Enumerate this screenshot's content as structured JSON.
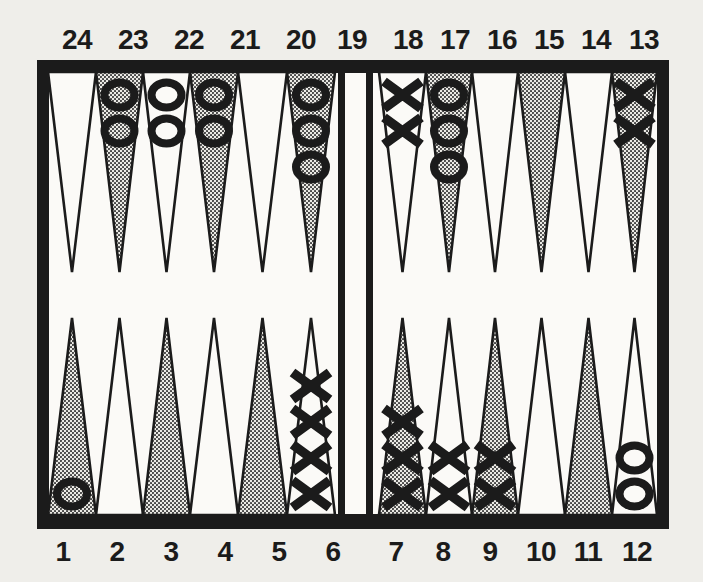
{
  "page": {
    "background_color": "#efeeea"
  },
  "board": {
    "ink_color": "#1b1b1b",
    "field_color": "#fbfaf7",
    "shaded_point_style": "halftone-dots",
    "halftone_dot_color": "#3c3c3c",
    "halftone_bg_color": "#ecebe6",
    "top_labels": [
      "24",
      "23",
      "22",
      "21",
      "20",
      "19",
      "18",
      "17",
      "16",
      "15",
      "14",
      "13"
    ],
    "bottom_labels": [
      "1",
      "2",
      "3",
      "4",
      "5",
      "6",
      "7",
      "8",
      "9",
      "10",
      "11",
      "12"
    ],
    "piece_symbols": {
      "o_player": "O",
      "x_player": "X"
    },
    "bar_checkers": 0,
    "points": [
      {
        "number": 1,
        "side": "bottom",
        "shaded": true,
        "checkers": {
          "symbol": "O",
          "count": 1
        }
      },
      {
        "number": 2,
        "side": "bottom",
        "shaded": false,
        "checkers": null
      },
      {
        "number": 3,
        "side": "bottom",
        "shaded": true,
        "checkers": null
      },
      {
        "number": 4,
        "side": "bottom",
        "shaded": false,
        "checkers": null
      },
      {
        "number": 5,
        "side": "bottom",
        "shaded": true,
        "checkers": null
      },
      {
        "number": 6,
        "side": "bottom",
        "shaded": false,
        "checkers": {
          "symbol": "X",
          "count": 4
        }
      },
      {
        "number": 7,
        "side": "bottom",
        "shaded": true,
        "checkers": {
          "symbol": "X",
          "count": 3
        }
      },
      {
        "number": 8,
        "side": "bottom",
        "shaded": false,
        "checkers": {
          "symbol": "X",
          "count": 2
        }
      },
      {
        "number": 9,
        "side": "bottom",
        "shaded": true,
        "checkers": {
          "symbol": "X",
          "count": 2
        }
      },
      {
        "number": 10,
        "side": "bottom",
        "shaded": false,
        "checkers": null
      },
      {
        "number": 11,
        "side": "bottom",
        "shaded": true,
        "checkers": null
      },
      {
        "number": 12,
        "side": "bottom",
        "shaded": false,
        "checkers": {
          "symbol": "O",
          "count": 2
        }
      },
      {
        "number": 13,
        "side": "top",
        "shaded": true,
        "checkers": {
          "symbol": "X",
          "count": 2
        }
      },
      {
        "number": 14,
        "side": "top",
        "shaded": false,
        "checkers": null
      },
      {
        "number": 15,
        "side": "top",
        "shaded": true,
        "checkers": null
      },
      {
        "number": 16,
        "side": "top",
        "shaded": false,
        "checkers": null
      },
      {
        "number": 17,
        "side": "top",
        "shaded": true,
        "checkers": {
          "symbol": "O",
          "count": 3
        }
      },
      {
        "number": 18,
        "side": "top",
        "shaded": false,
        "checkers": {
          "symbol": "X",
          "count": 2
        }
      },
      {
        "number": 19,
        "side": "top",
        "shaded": true,
        "checkers": {
          "symbol": "O",
          "count": 3
        }
      },
      {
        "number": 20,
        "side": "top",
        "shaded": false,
        "checkers": null
      },
      {
        "number": 21,
        "side": "top",
        "shaded": true,
        "checkers": {
          "symbol": "O",
          "count": 2
        }
      },
      {
        "number": 22,
        "side": "top",
        "shaded": false,
        "checkers": {
          "symbol": "O",
          "count": 2
        }
      },
      {
        "number": 23,
        "side": "top",
        "shaded": true,
        "checkers": {
          "symbol": "O",
          "count": 2
        }
      },
      {
        "number": 24,
        "side": "top",
        "shaded": false,
        "checkers": null
      }
    ]
  }
}
